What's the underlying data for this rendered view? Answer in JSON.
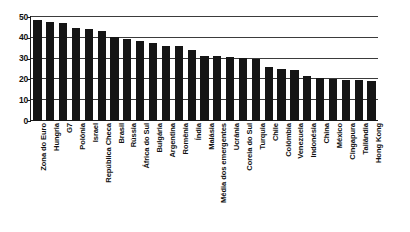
{
  "chart_data": {
    "type": "bar",
    "title": "",
    "subtitle": "",
    "xlabel": "",
    "ylabel": "",
    "ylim": [
      0,
      50
    ],
    "yticks": [
      0,
      10,
      20,
      30,
      40,
      50
    ],
    "grid": true,
    "legend": false,
    "orientation": "vertical",
    "bar_color": "#151515",
    "categories": [
      "Zona do Euro",
      "Hungria",
      "G7",
      "Polônia",
      "Israel",
      "República Checa",
      "Brasil",
      "Rússia",
      "África do Sul",
      "Bulgária",
      "Argentina",
      "Romênia",
      "Índia",
      "Malásia",
      "Média dos emergentes",
      "Ucrânia",
      "Coreia do Sul",
      "Turquia",
      "Chile",
      "Colômbia",
      "Venezuela",
      "Indonésia",
      "China",
      "México",
      "Cingapura",
      "Tailândia",
      "Hong Kong"
    ],
    "values": [
      48.6,
      47.6,
      47.0,
      44.5,
      44.2,
      43.5,
      40.6,
      39.6,
      38.5,
      37.5,
      36.0,
      35.9,
      34.0,
      31.2,
      31.1,
      30.7,
      30.2,
      29.6,
      26.2,
      25.2,
      24.6,
      21.6,
      20.7,
      20.2,
      19.8,
      19.5,
      19.2
    ]
  },
  "axis": {
    "y_tick_labels": [
      "50",
      "40",
      "30",
      "20",
      "10",
      "0"
    ]
  }
}
